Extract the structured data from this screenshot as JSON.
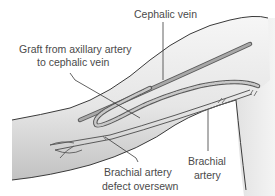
{
  "diagram": {
    "labels": {
      "cephalic_vein": "Cephalic vein",
      "graft_line1": "Graft from axillary artery",
      "graft_line2": "to cephalic vein",
      "brachial_defect_line1": "Brachial artery",
      "brachial_defect_line2": "defect oversewn",
      "brachial_artery_line1": "Brachial",
      "brachial_artery_line2": "artery"
    },
    "colors": {
      "skin_light": "#f2f2f2",
      "skin_shade": "#c8c8c8",
      "outline": "#3a3a3a",
      "vessel": "#8a8a8a",
      "graft_fill": "#b5b5b5",
      "text": "#4a4a4a"
    }
  }
}
